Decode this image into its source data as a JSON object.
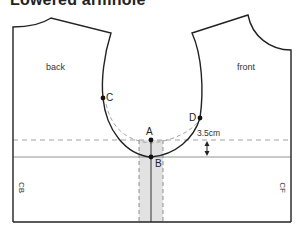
{
  "title": "Lowered armhole",
  "pieces": {
    "back": {
      "label": "back",
      "edge_label": "CB"
    },
    "front": {
      "label": "front",
      "edge_label": "CF"
    }
  },
  "points": {
    "A": "A",
    "B": "B",
    "C": "C",
    "D": "D"
  },
  "measurement": {
    "label": "3.5cm",
    "value": 3.5,
    "unit": "cm"
  },
  "colors": {
    "line": "#222222",
    "dashed": "#999999",
    "shade": "#e2e2e2"
  }
}
